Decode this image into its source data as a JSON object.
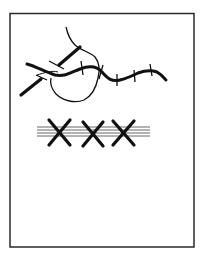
{
  "figure": {
    "frame": {
      "x": 10,
      "y": 13,
      "width": 184,
      "height": 234,
      "stroke": "#2a2a2a"
    },
    "colors": {
      "ink": "#111111",
      "gray_lines": "#777777"
    },
    "elements": [
      {
        "name": "winding-railway-line",
        "label": "railway with cross ties"
      },
      {
        "name": "thin-curve-loop",
        "label": "looping path"
      },
      {
        "name": "short-thick-road-segments",
        "label": "road segments"
      },
      {
        "name": "three-x-marks-on-parallel-lines",
        "label": "XXX over parallel lines"
      }
    ]
  }
}
